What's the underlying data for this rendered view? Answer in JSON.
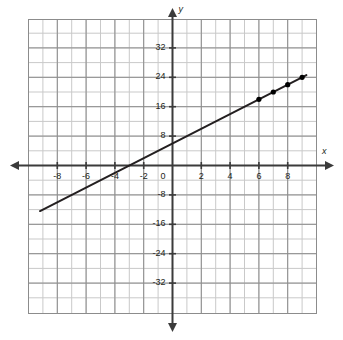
{
  "chart_data": {
    "type": "line",
    "title": "",
    "xlabel": "x",
    "ylabel": "y",
    "xlim": [
      -9.5,
      9.5
    ],
    "ylim": [
      -38,
      38
    ],
    "grid": true,
    "legend": false,
    "x_major_step": 2,
    "y_major_step": 8,
    "x_minor_step": 1,
    "y_minor_step": 4,
    "xticks": [
      -8,
      -6,
      -4,
      -2,
      2,
      4,
      6,
      8
    ],
    "xtick_labels": [
      "-8",
      "-6",
      "-4",
      "-2",
      "2",
      "4",
      "6",
      "8"
    ],
    "yticks": [
      32,
      24,
      16,
      8,
      -8,
      -16,
      -24,
      -32
    ],
    "ytick_labels": [
      "32",
      "24",
      "16",
      "8",
      "-8",
      "-16",
      "-24",
      "-32"
    ],
    "origin_label": "0",
    "series": [
      {
        "name": "line",
        "equation": "y = 2x + 6",
        "slope": 2,
        "y_intercept": 6,
        "x_intercept": -3,
        "color": "#231f20",
        "endpoints": [
          {
            "x": -9.2,
            "y": -12.4
          },
          {
            "x": 9.3,
            "y": 24.6
          }
        ],
        "points": [
          {
            "x": 6,
            "y": 18
          },
          {
            "x": 7,
            "y": 20
          },
          {
            "x": 8,
            "y": 22
          },
          {
            "x": 9,
            "y": 24
          }
        ]
      }
    ],
    "colors": {
      "axis": "#3b3b3b",
      "grid_major": "#8c8c8c",
      "grid_minor": "#c9c9c9",
      "line": "#231f20",
      "marker": "#000000",
      "background": "#ffffff"
    }
  }
}
